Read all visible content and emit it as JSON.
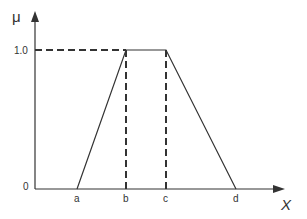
{
  "diagram": {
    "y_axis_label": "μ",
    "x_axis_label": "X",
    "y_ticks": [
      {
        "label": "1.0",
        "value": 1.0
      },
      {
        "label": "0",
        "value": 0
      }
    ],
    "x_points": [
      {
        "label": "a"
      },
      {
        "label": "b"
      },
      {
        "label": "c"
      },
      {
        "label": "d"
      }
    ],
    "line_color": "#333333"
  }
}
